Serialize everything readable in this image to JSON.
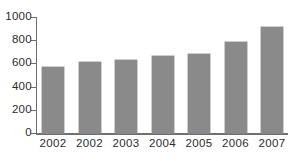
{
  "chart_data": {
    "type": "bar",
    "title": "",
    "subtitle": "",
    "xlabel": "",
    "ylabel": "",
    "categories": [
      "2002",
      "2002",
      "2003",
      "2004",
      "2005",
      "2006",
      "2007"
    ],
    "values": [
      570,
      615,
      630,
      660,
      680,
      785,
      915
    ],
    "series": [
      {
        "name": "",
        "values": [
          570,
          615,
          630,
          660,
          680,
          785,
          915
        ]
      }
    ],
    "ylim": [
      0,
      1000
    ],
    "yticks": [
      0,
      200,
      400,
      600,
      800,
      1000
    ],
    "ytick_labels": [
      "0",
      "200",
      "400",
      "600",
      "800",
      "1000"
    ],
    "grid": false,
    "legend": false,
    "legend_position": "none",
    "bar_color": "#8a8a8a",
    "axis_color": "#6f6f6f",
    "text_color": "#2b2b2b",
    "background": "#ffffff",
    "annotations": []
  }
}
